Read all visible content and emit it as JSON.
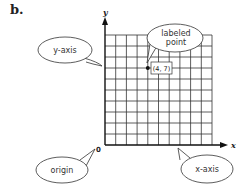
{
  "figure": {
    "panel_label": "b.",
    "axes": {
      "x_label": "x",
      "y_label": "y",
      "origin_label": "0"
    },
    "grid": {
      "columns": 10,
      "rows": 10
    },
    "callouts": {
      "y_axis": "y-axis",
      "x_axis": "x-axis",
      "origin": "origin",
      "labeled_point_line1": "labeled",
      "labeled_point_line2": "point"
    },
    "point": {
      "x": 4,
      "y": 7,
      "label": "(4, 7)"
    },
    "colors": {
      "ink": "#222222",
      "grid": "#333333",
      "background": "#ffffff"
    }
  }
}
